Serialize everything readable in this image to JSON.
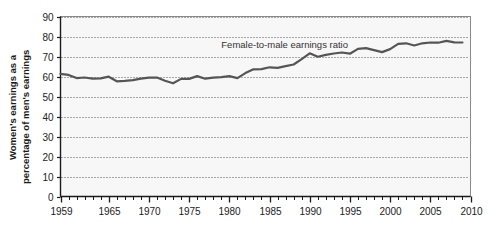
{
  "chart_data": {
    "type": "line",
    "title": "",
    "subtitle": "",
    "xlabel": "",
    "ylabel": "Women's earnings as a percentage of men's earnings",
    "ylabel_line1": "Women's earnings as a",
    "ylabel_line2": "percentage of men's earnings",
    "xlim": [
      1959,
      2010
    ],
    "ylim": [
      0,
      90
    ],
    "yticks": [
      0,
      10,
      20,
      30,
      40,
      50,
      60,
      70,
      80,
      90
    ],
    "ytick_labels": [
      "0",
      "10",
      "20",
      "30",
      "40",
      "50",
      "60",
      "70",
      "80",
      "90"
    ],
    "xticks": [
      1959,
      1965,
      1970,
      1975,
      1980,
      1985,
      1990,
      1995,
      2000,
      2005,
      2010
    ],
    "xtick_labels": [
      "1959",
      "1965",
      "1970",
      "1975",
      "1980",
      "1985",
      "1990",
      "1995",
      "2000",
      "2005",
      "2010"
    ],
    "x_minor_tick_interval": 1,
    "grid": "horizontal-dotted",
    "legend_position": "none",
    "annotations": [
      {
        "text": "Female-to-male earnings ratio",
        "x": 1979,
        "y": 74.5
      }
    ],
    "series": [
      {
        "name": "Female-to-male earnings ratio",
        "color": "#555555",
        "line_width": 2.2,
        "x": [
          1959,
          1960,
          1961,
          1962,
          1963,
          1964,
          1965,
          1966,
          1967,
          1968,
          1969,
          1970,
          1971,
          1972,
          1973,
          1974,
          1975,
          1976,
          1977,
          1978,
          1979,
          1980,
          1981,
          1982,
          1983,
          1984,
          1985,
          1986,
          1987,
          1988,
          1989,
          1990,
          1991,
          1992,
          1993,
          1994,
          1995,
          1996,
          1997,
          1998,
          1999,
          2000,
          2001,
          2002,
          2003,
          2004,
          2005,
          2006,
          2007,
          2008,
          2009
        ],
        "values": [
          61.3,
          60.8,
          59.2,
          59.5,
          58.9,
          59.1,
          59.9,
          57.6,
          57.8,
          58.2,
          58.9,
          59.4,
          59.5,
          57.9,
          56.6,
          58.8,
          58.8,
          60.2,
          58.9,
          59.4,
          59.7,
          60.2,
          59.2,
          61.7,
          63.6,
          63.7,
          64.6,
          64.3,
          65.2,
          66.0,
          68.7,
          71.6,
          69.9,
          70.8,
          71.5,
          72.0,
          71.4,
          73.8,
          74.2,
          73.2,
          72.2,
          73.7,
          76.3,
          76.6,
          75.5,
          76.6,
          77.0,
          76.9,
          77.8,
          77.1,
          77.0
        ]
      }
    ]
  },
  "colors": {
    "plot_background": "#f7f7f7",
    "plot_border": "#8a8a8a",
    "gridline": "#555555",
    "line": "#555555",
    "text": "#1a1a1a",
    "page_background": "#ffffff"
  }
}
